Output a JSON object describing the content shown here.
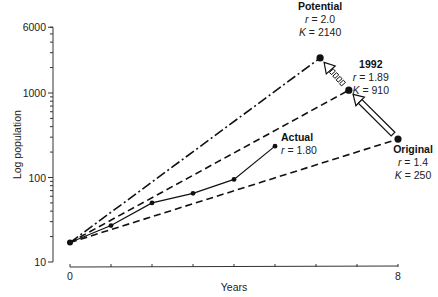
{
  "chart_data": {
    "type": "line",
    "title": "",
    "xlabel": "Years",
    "ylabel": "Log population",
    "xlim": [
      0,
      8
    ],
    "ylim": [
      10,
      6000
    ],
    "yscale": "log",
    "x_tick_labels": [
      {
        "value": 0,
        "label": "0"
      },
      {
        "value": 8,
        "label": "8"
      }
    ],
    "x_minor_ticks": [
      1,
      2,
      3,
      4,
      5,
      6,
      7
    ],
    "y_tick_labels": [
      {
        "value": 10,
        "label": "10"
      },
      {
        "value": 100,
        "label": "100"
      },
      {
        "value": 1000,
        "label": "1000"
      },
      {
        "value": 6000,
        "label": "6000"
      }
    ],
    "grid": false,
    "start_point": {
      "x": 0,
      "y": 17
    },
    "series": [
      {
        "name": "Actual",
        "style": "solid",
        "markers": true,
        "points": [
          {
            "x": 0,
            "y": 17
          },
          {
            "x": 1,
            "y": 27
          },
          {
            "x": 2,
            "y": 50
          },
          {
            "x": 3,
            "y": 65
          },
          {
            "x": 4,
            "y": 95
          },
          {
            "x": 5,
            "y": 235
          }
        ],
        "annotation": {
          "title": "Actual",
          "lines": [
            {
              "var": "r",
              "value": "1.80"
            }
          ]
        }
      },
      {
        "name": "Potential",
        "style": "dash-dot",
        "markers": false,
        "points": [
          {
            "x": 0,
            "y": 17
          },
          {
            "x": 6.1,
            "y": 2600
          }
        ],
        "endpoint": true,
        "annotation": {
          "title": "Potential",
          "lines": [
            {
              "var": "r",
              "value": "2.0"
            },
            {
              "var": "K",
              "value": "2140"
            }
          ]
        }
      },
      {
        "name": "1992",
        "style": "dashed",
        "markers": false,
        "points": [
          {
            "x": 0,
            "y": 17
          },
          {
            "x": 6.8,
            "y": 1080
          }
        ],
        "endpoint": true,
        "annotation": {
          "title": "1992",
          "lines": [
            {
              "var": "r",
              "value": "1.89"
            },
            {
              "var": "K",
              "value": "910"
            }
          ]
        }
      },
      {
        "name": "Original",
        "style": "dashed",
        "markers": false,
        "points": [
          {
            "x": 0,
            "y": 17
          },
          {
            "x": 8,
            "y": 285
          }
        ],
        "endpoint": true,
        "annotation": {
          "title": "Original",
          "lines": [
            {
              "var": "r",
              "value": "1.4"
            },
            {
              "var": "K",
              "value": "250"
            }
          ]
        }
      }
    ],
    "arrows": [
      {
        "from": "Original",
        "to": "1992",
        "style": "hollow-solid"
      },
      {
        "from": "1992",
        "to": "Potential",
        "style": "hollow-dotted"
      }
    ]
  }
}
